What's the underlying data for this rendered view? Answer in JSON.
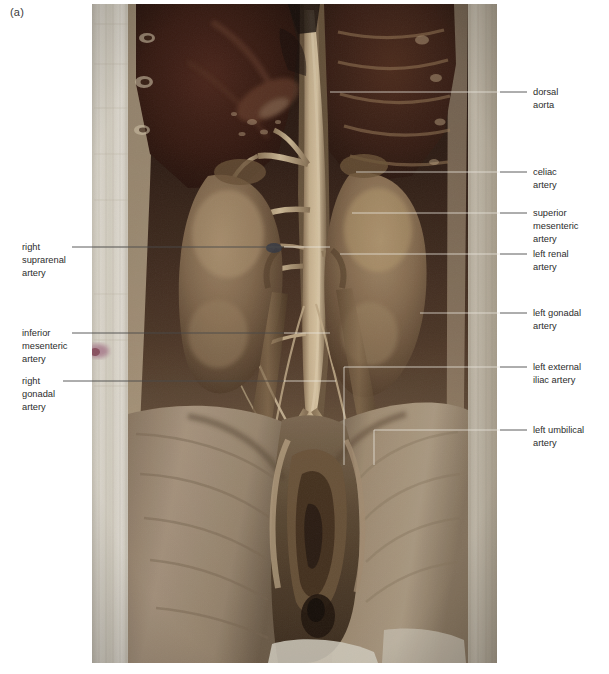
{
  "figure": {
    "panel_letter": "(a)",
    "photo": {
      "left": 92,
      "top": 4,
      "width": 405,
      "height": 659,
      "colors": {
        "cloth": "#e9e6dc",
        "liver_dark": "#2e1a15",
        "lung_dark": "#3b2018",
        "kidney": "#8b7257",
        "fascia": "#b3a088",
        "aorta": "#c3ae90",
        "vessel_highlight": "#d8c8ab",
        "muscle_tan": "#a08a6f",
        "thigh": "#a3917c",
        "deep_shadow": "#1d120d",
        "pink_mark": "#b07f95",
        "background": "#6b5a49"
      }
    }
  },
  "labels_left": [
    {
      "name": "right-suprarenal-artery",
      "text": "right\nsuprarenal\nartery",
      "text_x": 22,
      "text_y": 241,
      "leader": {
        "x1": 72,
        "y1": 247,
        "x2": 284,
        "y2": 247
      },
      "leader_in": {
        "x1": 284,
        "y1": 247,
        "x2": 330,
        "y2": 247
      }
    },
    {
      "name": "inferior-mesenteric-artery",
      "text": "inferior\nmesenteric\nartery",
      "text_x": 22,
      "text_y": 327,
      "leader": {
        "x1": 72,
        "y1": 333,
        "x2": 284,
        "y2": 333
      },
      "leader_in": {
        "x1": 284,
        "y1": 333,
        "x2": 330,
        "y2": 333
      }
    },
    {
      "name": "right-gonadal-artery",
      "text": "right\ngonadal\nartery",
      "text_x": 22,
      "text_y": 375,
      "leader": {
        "x1": 63,
        "y1": 381,
        "x2": 284,
        "y2": 381
      },
      "leader_in": {
        "x1": 284,
        "y1": 381,
        "x2": 336,
        "y2": 381
      }
    }
  ],
  "labels_right": [
    {
      "name": "dorsal-aorta",
      "text": "dorsal\naorta",
      "text_x": 533,
      "text_y": 86,
      "leader": {
        "x1": 527,
        "y1": 92,
        "x2": 500,
        "y2": 92
      },
      "leader_in": {
        "x1": 500,
        "y1": 92,
        "x2": 330,
        "y2": 92
      }
    },
    {
      "name": "celiac-artery",
      "text": "celiac\nartery",
      "text_x": 533,
      "text_y": 166,
      "leader": {
        "x1": 527,
        "y1": 172,
        "x2": 500,
        "y2": 172
      },
      "leader_in": {
        "x1": 500,
        "y1": 172,
        "x2": 356,
        "y2": 172
      }
    },
    {
      "name": "superior-mesenteric-artery",
      "text": "superior\nmesenteric\nartery",
      "text_x": 533,
      "text_y": 207,
      "leader": {
        "x1": 527,
        "y1": 213,
        "x2": 500,
        "y2": 213
      },
      "leader_in": {
        "x1": 500,
        "y1": 213,
        "x2": 352,
        "y2": 213
      }
    },
    {
      "name": "left-renal-artery",
      "text": "left renal\nartery",
      "text_x": 533,
      "text_y": 248,
      "leader": {
        "x1": 527,
        "y1": 254,
        "x2": 500,
        "y2": 254
      },
      "leader_in": {
        "x1": 500,
        "y1": 254,
        "x2": 340,
        "y2": 254
      }
    },
    {
      "name": "left-gonadal-artery",
      "text": "left gonadal\nartery",
      "text_x": 533,
      "text_y": 307,
      "leader": {
        "x1": 527,
        "y1": 313,
        "x2": 500,
        "y2": 313
      },
      "leader_in": {
        "x1": 500,
        "y1": 313,
        "x2": 420,
        "y2": 313
      }
    },
    {
      "name": "left-external-iliac-artery",
      "text": "left external\niliac artery",
      "text_x": 533,
      "text_y": 361,
      "leader": {
        "x1": 527,
        "y1": 367,
        "x2": 500,
        "y2": 367
      },
      "leader_in": {
        "x1": 500,
        "y1": 367,
        "x2": 344,
        "y2": 367
      },
      "leader_drop": {
        "x": 344,
        "y1": 367,
        "y2": 465
      }
    },
    {
      "name": "left-umbilical-artery",
      "text": "left umbilical\nartery",
      "text_x": 533,
      "text_y": 424,
      "leader": {
        "x1": 527,
        "y1": 430,
        "x2": 500,
        "y2": 430
      },
      "leader_in": {
        "x1": 500,
        "y1": 430,
        "x2": 374,
        "y2": 430
      },
      "leader_drop": {
        "x": 374,
        "y1": 430,
        "y2": 465
      }
    }
  ]
}
